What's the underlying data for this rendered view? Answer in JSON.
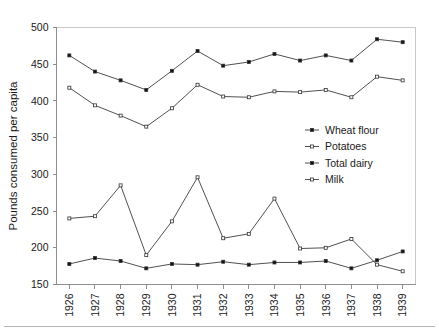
{
  "chart_data": {
    "type": "line",
    "title": "",
    "subtitle": "",
    "xlabel": "",
    "ylabel": "Pounds consumed per capita",
    "ylim": [
      150,
      500
    ],
    "ytick_step": 50,
    "yticks": [
      150,
      200,
      250,
      300,
      350,
      400,
      450,
      500
    ],
    "grid": false,
    "legend_position": "center-right",
    "categories": [
      "1926",
      "1927",
      "1928",
      "1929",
      "1930",
      "1931",
      "1932",
      "1933",
      "1934",
      "1935",
      "1936",
      "1937",
      "1938",
      "1939"
    ],
    "series": [
      {
        "name": "Wheat flour",
        "marker": "square-filled",
        "values": [
          178,
          186,
          182,
          172,
          178,
          177,
          181,
          177,
          180,
          180,
          182,
          172,
          183,
          195
        ]
      },
      {
        "name": "Potatoes",
        "marker": "square-open",
        "values": [
          240,
          243,
          285,
          190,
          236,
          296,
          213,
          219,
          267,
          199,
          200,
          212,
          177,
          168
        ]
      },
      {
        "name": "Total dairy",
        "marker": "square-filled",
        "values": [
          462,
          440,
          428,
          415,
          441,
          468,
          448,
          453,
          464,
          455,
          462,
          455,
          484,
          480
        ]
      },
      {
        "name": "Milk",
        "marker": "square-open",
        "values": [
          418,
          394,
          380,
          365,
          390,
          422,
          406,
          405,
          413,
          412,
          415,
          405,
          433,
          428
        ]
      }
    ]
  },
  "legend": {
    "items": [
      {
        "label": "Wheat flour"
      },
      {
        "label": "Potatoes"
      },
      {
        "label": "Total dairy"
      },
      {
        "label": "Milk"
      }
    ]
  },
  "axis": {
    "y_title": "Pounds consumed per capita",
    "y_tick_labels": [
      "500",
      "450",
      "400",
      "350",
      "300",
      "250",
      "200",
      "150"
    ],
    "x_tick_labels": [
      "1926",
      "1927",
      "1928",
      "1929",
      "1930",
      "1931",
      "1932",
      "1933",
      "1934",
      "1935",
      "1936",
      "1937",
      "1938",
      "1939"
    ]
  },
  "colors": {
    "line": "#3d3d3d",
    "axis": "#8f8f8f",
    "frame": "#c8c8c8",
    "text": "#1a1a1a",
    "background": "#ffffff"
  }
}
